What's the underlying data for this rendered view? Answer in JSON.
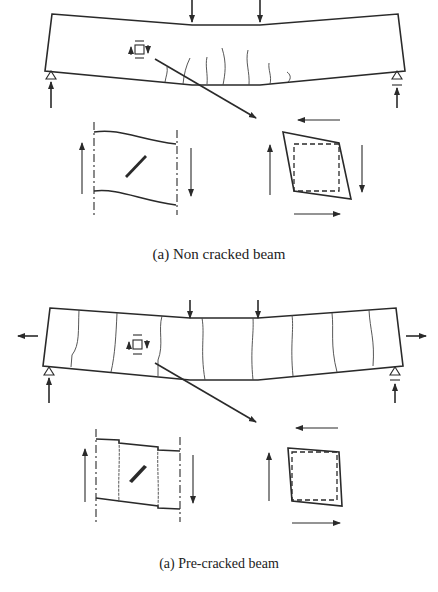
{
  "figure": {
    "panels": [
      {
        "id": "non-cracked",
        "caption": "(a) Non cracked beam",
        "beam_state": "flexural cracks at bottom mid-span",
        "inset_left": "shear-deformed element with diagonal crack",
        "inset_right": "shear-distorted element (dashed original square)"
      },
      {
        "id": "pre-cracked",
        "caption": "(a) Pre-cracked beam",
        "beam_state": "full-depth vertical cracks with axial tension",
        "inset_left": "cracked segments with diagonal crack",
        "inset_right": "slightly distorted element (dashed original square)"
      }
    ],
    "colors": {
      "line": "#2a2a2a",
      "background": "#ffffff"
    }
  }
}
